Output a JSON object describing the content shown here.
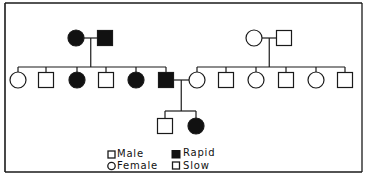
{
  "diagram": {
    "type": "pedigree",
    "colors": {
      "line": "#1a1a1a",
      "affected_fill": "#111111",
      "unaffected_fill": "#ffffff",
      "background": "#ffffff"
    },
    "generations": [
      {
        "id": "I",
        "couples": [
          {
            "female": {
              "x": 76,
              "phenotype": "Rapid"
            },
            "male": {
              "x": 105,
              "phenotype": "Rapid"
            }
          },
          {
            "female": {
              "x": 254,
              "phenotype": "Slow"
            },
            "male": {
              "x": 284,
              "phenotype": "Slow"
            }
          }
        ]
      },
      {
        "id": "II",
        "individuals": [
          {
            "sex": "female",
            "x": 18,
            "phenotype": "Slow"
          },
          {
            "sex": "male",
            "x": 46,
            "phenotype": "Slow"
          },
          {
            "sex": "female",
            "x": 77,
            "phenotype": "Rapid"
          },
          {
            "sex": "male",
            "x": 106,
            "phenotype": "Slow"
          },
          {
            "sex": "female",
            "x": 136,
            "phenotype": "Rapid"
          },
          {
            "sex": "male",
            "x": 166,
            "phenotype": "Rapid"
          },
          {
            "sex": "female",
            "x": 197,
            "phenotype": "Slow"
          },
          {
            "sex": "male",
            "x": 226,
            "phenotype": "Slow"
          },
          {
            "sex": "female",
            "x": 256,
            "phenotype": "Slow"
          },
          {
            "sex": "male",
            "x": 286,
            "phenotype": "Slow"
          },
          {
            "sex": "female",
            "x": 316,
            "phenotype": "Slow"
          },
          {
            "sex": "male",
            "x": 345,
            "phenotype": "Slow"
          }
        ]
      },
      {
        "id": "III",
        "individuals": [
          {
            "sex": "male",
            "x": 165,
            "phenotype": "Slow"
          },
          {
            "sex": "female",
            "x": 196,
            "phenotype": "Rapid"
          }
        ]
      }
    ]
  },
  "legend": {
    "male": "Male",
    "female": "Female",
    "rapid": "Rapid",
    "slow": "Slow"
  }
}
